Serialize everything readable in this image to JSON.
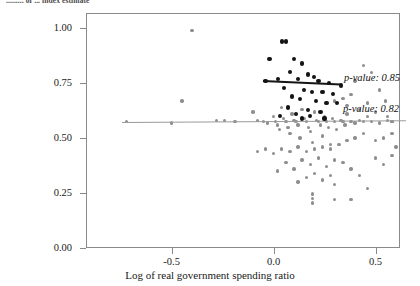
{
  "title_partial": "......... of ... index estimate",
  "axes": {
    "xlabel": "Log of real government spending ratio",
    "ylabel": "",
    "xticks": [
      "-0.5",
      "0.0",
      "0.5"
    ],
    "yticks": [
      "0.00",
      "0.25",
      "0.50",
      "0.75",
      "1.00"
    ]
  },
  "annotations": {
    "dark_pvalue": "p-value: 0.85",
    "grey_pvalue": "p-value: 0.82"
  },
  "colors": {
    "dark_series": "#141414",
    "grey_series": "#8e8e8e",
    "frame": "#8a8a8a",
    "background": "#ffffff"
  },
  "chart_data": {
    "type": "scatter",
    "title": "",
    "xlabel": "Log of real government spending ratio",
    "ylabel": "",
    "xlim": [
      -0.92,
      0.62
    ],
    "ylim": [
      0.0,
      1.07
    ],
    "xticks": [
      -0.5,
      0.0,
      0.5
    ],
    "yticks": [
      0.0,
      0.25,
      0.5,
      0.75,
      1.0
    ],
    "grid": false,
    "legend": "none",
    "series": [
      {
        "name": "dark-series",
        "color": "#141414",
        "marker": "circle",
        "points": [
          [
            0.04,
            0.94
          ],
          [
            0.06,
            0.94
          ],
          [
            -0.02,
            0.86
          ],
          [
            0.1,
            0.86
          ],
          [
            0.14,
            0.84
          ],
          [
            0.08,
            0.8
          ],
          [
            0.17,
            0.79
          ],
          [
            0.2,
            0.78
          ],
          [
            -0.04,
            0.76
          ],
          [
            0.02,
            0.77
          ],
          [
            0.12,
            0.77
          ],
          [
            0.22,
            0.76
          ],
          [
            0.27,
            0.75
          ],
          [
            0.33,
            0.74
          ],
          [
            0.05,
            0.73
          ],
          [
            0.15,
            0.72
          ],
          [
            0.19,
            0.71
          ],
          [
            0.24,
            0.71
          ],
          [
            0.29,
            0.7
          ],
          [
            0.09,
            0.69
          ],
          [
            0.13,
            0.68
          ],
          [
            0.21,
            0.67
          ],
          [
            0.26,
            0.66
          ],
          [
            0.31,
            0.66
          ],
          [
            0.07,
            0.64
          ],
          [
            0.17,
            0.63
          ],
          [
            0.23,
            0.62
          ],
          [
            0.11,
            0.61
          ],
          [
            0.18,
            0.6
          ],
          [
            0.03,
            0.6
          ],
          [
            0.14,
            0.59
          ],
          [
            0.25,
            0.59
          ]
        ],
        "fit_line": {
          "x": [
            -0.05,
            0.33
          ],
          "y": [
            0.764,
            0.748
          ],
          "pvalue": 0.85
        }
      },
      {
        "name": "grey-series",
        "color": "#8e8e8e",
        "marker": "circle",
        "points": [
          [
            -0.72,
            0.575
          ],
          [
            -0.5,
            0.57
          ],
          [
            -0.45,
            0.67
          ],
          [
            -0.4,
            0.99
          ],
          [
            -0.28,
            0.58
          ],
          [
            -0.24,
            0.58
          ],
          [
            -0.19,
            0.575
          ],
          [
            -0.1,
            0.62
          ],
          [
            -0.08,
            0.58
          ],
          [
            -0.05,
            0.575
          ],
          [
            -0.03,
            0.57
          ],
          [
            0.0,
            0.6
          ],
          [
            0.01,
            0.575
          ],
          [
            0.02,
            0.56
          ],
          [
            0.03,
            0.54
          ],
          [
            0.04,
            0.64
          ],
          [
            0.05,
            0.59
          ],
          [
            0.06,
            0.575
          ],
          [
            0.07,
            0.55
          ],
          [
            0.08,
            0.52
          ],
          [
            0.09,
            0.61
          ],
          [
            0.1,
            0.58
          ],
          [
            0.11,
            0.575
          ],
          [
            0.12,
            0.56
          ],
          [
            0.13,
            0.5
          ],
          [
            0.14,
            0.63
          ],
          [
            0.15,
            0.59
          ],
          [
            0.16,
            0.575
          ],
          [
            0.17,
            0.55
          ],
          [
            0.18,
            0.53
          ],
          [
            0.19,
            0.48
          ],
          [
            0.2,
            0.62
          ],
          [
            0.21,
            0.58
          ],
          [
            0.22,
            0.575
          ],
          [
            0.23,
            0.56
          ],
          [
            0.24,
            0.51
          ],
          [
            0.25,
            0.6
          ],
          [
            0.26,
            0.575
          ],
          [
            0.27,
            0.55
          ],
          [
            0.28,
            0.47
          ],
          [
            0.29,
            0.59
          ],
          [
            0.3,
            0.575
          ],
          [
            0.31,
            0.54
          ],
          [
            0.33,
            0.58
          ],
          [
            0.34,
            0.575
          ],
          [
            0.35,
            0.56
          ],
          [
            0.36,
            0.61
          ],
          [
            0.38,
            0.575
          ],
          [
            0.4,
            0.57
          ],
          [
            0.42,
            0.58
          ],
          [
            0.44,
            0.575
          ],
          [
            0.46,
            0.6
          ],
          [
            0.48,
            0.575
          ],
          [
            0.52,
            0.57
          ],
          [
            0.58,
            0.575
          ],
          [
            0.44,
            0.83
          ],
          [
            0.48,
            0.8
          ],
          [
            0.4,
            0.76
          ],
          [
            0.52,
            0.72
          ],
          [
            0.38,
            0.7
          ],
          [
            0.55,
            0.67
          ],
          [
            0.46,
            0.66
          ],
          [
            0.34,
            0.68
          ],
          [
            0.3,
            0.67
          ],
          [
            0.36,
            0.65
          ],
          [
            0.42,
            0.63
          ],
          [
            0.5,
            0.62
          ],
          [
            0.56,
            0.6
          ],
          [
            0.58,
            0.52
          ],
          [
            0.54,
            0.5
          ],
          [
            0.5,
            0.49
          ],
          [
            0.44,
            0.52
          ],
          [
            0.4,
            0.5
          ],
          [
            0.36,
            0.49
          ],
          [
            0.32,
            0.47
          ],
          [
            0.28,
            0.45
          ],
          [
            0.24,
            0.46
          ],
          [
            0.2,
            0.45
          ],
          [
            0.16,
            0.44
          ],
          [
            0.12,
            0.46
          ],
          [
            0.08,
            0.44
          ],
          [
            0.04,
            0.45
          ],
          [
            0.0,
            0.43
          ],
          [
            -0.04,
            0.45
          ],
          [
            -0.08,
            0.44
          ],
          [
            0.22,
            0.41
          ],
          [
            0.3,
            0.4
          ],
          [
            0.14,
            0.4
          ],
          [
            0.06,
            0.39
          ],
          [
            0.18,
            0.38
          ],
          [
            0.26,
            0.37
          ],
          [
            0.34,
            0.39
          ],
          [
            0.38,
            0.36
          ],
          [
            0.1,
            0.36
          ],
          [
            0.02,
            0.35
          ],
          [
            0.2,
            0.34
          ],
          [
            0.28,
            0.33
          ],
          [
            0.16,
            0.32
          ],
          [
            0.24,
            0.31
          ],
          [
            0.12,
            0.3
          ],
          [
            0.3,
            0.29
          ],
          [
            0.19,
            0.245
          ],
          [
            0.19,
            0.225
          ],
          [
            0.19,
            0.205
          ],
          [
            0.42,
            0.33
          ],
          [
            0.46,
            0.27
          ],
          [
            0.3,
            0.22
          ],
          [
            0.38,
            0.22
          ],
          [
            0.5,
            0.41
          ],
          [
            0.54,
            0.38
          ],
          [
            0.58,
            0.42
          ],
          [
            0.6,
            0.46
          ],
          [
            0.58,
            0.575
          ],
          [
            0.56,
            0.58
          ]
        ],
        "fit_line": {
          "x": [
            -0.745,
            0.65
          ],
          "y": [
            0.573,
            0.581
          ],
          "pvalue": 0.82
        }
      }
    ]
  }
}
